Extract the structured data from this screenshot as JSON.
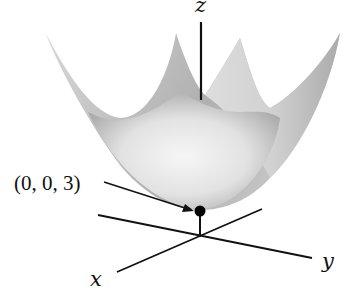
{
  "figure": {
    "axes": {
      "x_label": "x",
      "y_label": "y",
      "z_label": "z"
    },
    "point": {
      "label": "(0, 0, 3)",
      "description": "vertex of paraboloid"
    },
    "surface": {
      "type": "paraboloid",
      "colors": {
        "outer_shade": "#a9a9a9",
        "inner_shade": "#c4c4c4",
        "highlight": "#f4f4f4"
      }
    },
    "axis_color": "#111111"
  }
}
